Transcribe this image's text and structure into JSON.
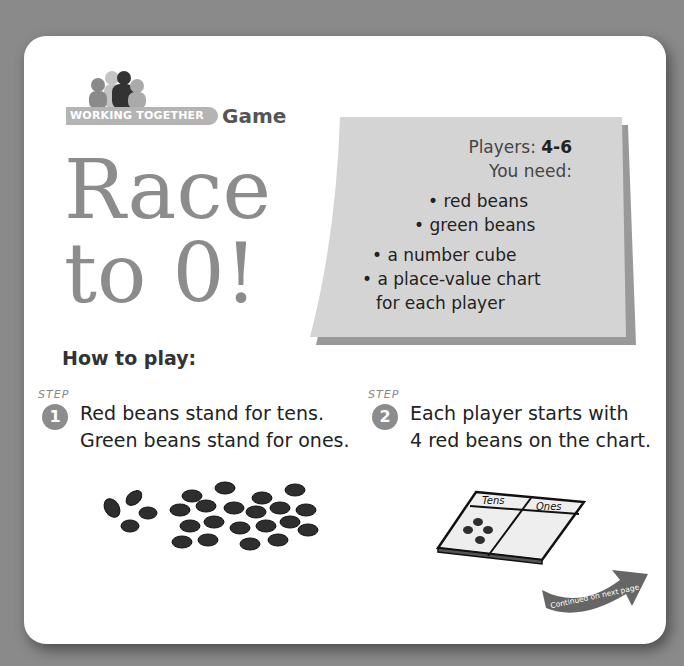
{
  "header": {
    "banner_label": "WORKING TOGETHER",
    "type_label": "Game"
  },
  "title": {
    "line1": "Race",
    "line2": "to 0!"
  },
  "needs": {
    "players_label": "Players:",
    "players_value": "4-6",
    "you_need_label": "You need:",
    "items": [
      "• red beans",
      "• green beans",
      "• a number cube",
      "• a place-value chart",
      "for each player"
    ]
  },
  "how_to_play": {
    "heading": "How to play:",
    "steps": [
      {
        "label": "STEP",
        "number": "1",
        "line1": "Red beans stand for tens.",
        "line2": "Green beans stand for ones."
      },
      {
        "label": "STEP",
        "number": "2",
        "line1": "Each player starts with",
        "line2": "4 red beans on the chart."
      }
    ]
  },
  "place_value_chart": {
    "col1": "Tens",
    "col2": "Ones"
  },
  "continued": {
    "label": "Continued on next page"
  },
  "colors": {
    "background": "#8a8a8a",
    "card": "#ffffff",
    "title": "#8c8c8c",
    "needs_panel": "#d4d4d4",
    "bean": "#2e2e2e"
  }
}
